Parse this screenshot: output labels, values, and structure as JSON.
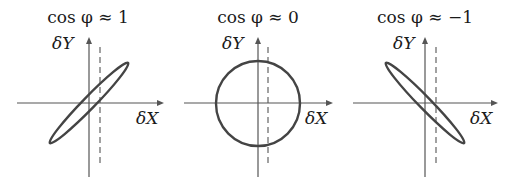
{
  "diagram": {
    "panels": [
      {
        "title": "cos φ ≈ 1",
        "y_label": "δY",
        "x_label": "δX",
        "shape": "ellipse",
        "orientation": "positive-slope (narrow, tilted up-right)",
        "description": "Lissajous curve collapses to a narrow ellipse along the +45° diagonal"
      },
      {
        "title": "cos φ ≈ 0",
        "y_label": "δY",
        "x_label": "δX",
        "shape": "circle",
        "orientation": "none",
        "description": "Lissajous curve is a circle centered at the origin"
      },
      {
        "title": "cos φ ≈ −1",
        "y_label": "δY",
        "x_label": "δX",
        "shape": "ellipse",
        "orientation": "negative-slope (narrow, tilted down-right)",
        "description": "Lissajous curve collapses to a narrow ellipse along the −45° diagonal"
      }
    ],
    "colors": {
      "axis": "#555555",
      "curve": "#444444",
      "text": "#1a1a1a",
      "background": "#ffffff"
    }
  }
}
